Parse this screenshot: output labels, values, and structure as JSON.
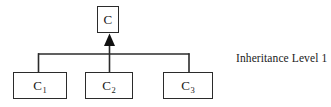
{
  "diagram": {
    "title": "Inheritance Level 1",
    "type": "class-inheritance-hierarchy",
    "canvas": {
      "width": 331,
      "height": 107,
      "background": "#ffffff"
    },
    "stroke_color": "#2b2b2b",
    "text_color": "#1a1a1a",
    "root": {
      "id": "C",
      "label": "C",
      "x": 97,
      "y": 6,
      "width": 22,
      "height": 27
    },
    "children": [
      {
        "id": "C1",
        "label": "C",
        "subscript": "1",
        "x": 13,
        "y": 72,
        "width": 54,
        "height": 27
      },
      {
        "id": "C2",
        "label": "C",
        "subscript": "2",
        "x": 85,
        "y": 72,
        "width": 48,
        "height": 27
      },
      {
        "id": "C3",
        "label": "C",
        "subscript": "3",
        "x": 163,
        "y": 72,
        "width": 50,
        "height": 27
      }
    ],
    "arrow": {
      "style": "solid-filled-triangle",
      "direction": "up",
      "target": "C"
    },
    "annotation": {
      "text": "Inheritance Level 1",
      "x": 236,
      "y": 52
    }
  }
}
